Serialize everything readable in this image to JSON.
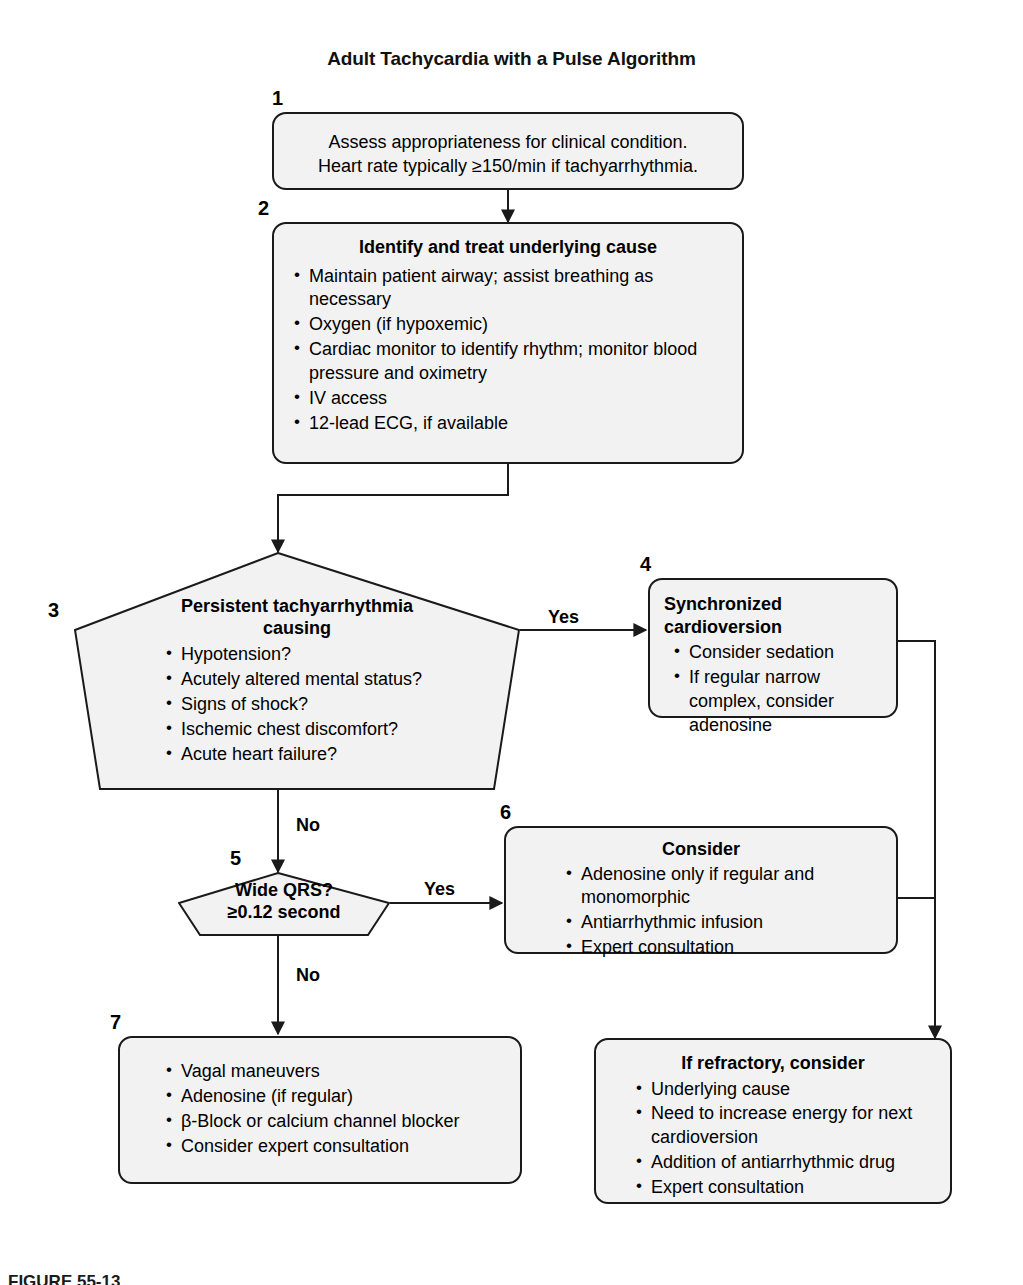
{
  "figure": {
    "title": "Adult Tachycardia with a Pulse Algorithm",
    "bottom_caption": "FIGURE 55-13"
  },
  "colors": {
    "box_fill": "#f2f2f2",
    "stroke": "#1a1a1a",
    "text": "#000000",
    "page_background": "#ffffff"
  },
  "nodes": {
    "step1": {
      "number": "1",
      "lines": [
        "Assess appropriateness for clinical condition.",
        "Heart rate typically ≥150/min if tachyarrhythmia."
      ]
    },
    "step2": {
      "number": "2",
      "title": "Identify and treat underlying cause",
      "bullets": [
        "Maintain patient airway; assist breathing as necessary",
        "Oxygen (if hypoxemic)",
        "Cardiac monitor to identify rhythm; monitor blood pressure and oximetry",
        "IV access",
        "12-lead ECG, if available"
      ]
    },
    "step3": {
      "number": "3",
      "title_line1": "Persistent tachyarrhythmia",
      "title_line2": "causing",
      "bullets": [
        "Hypotension?",
        "Acutely altered mental status?",
        "Signs of shock?",
        "Ischemic chest discomfort?",
        "Acute heart failure?"
      ]
    },
    "step4": {
      "number": "4",
      "title": "Synchronized cardioversion",
      "bullets": [
        "Consider sedation",
        "If regular narrow complex, consider adenosine"
      ]
    },
    "step5": {
      "number": "5",
      "line1": "Wide QRS?",
      "line2": "≥0.12 second"
    },
    "step6": {
      "number": "6",
      "title": "Consider",
      "bullets": [
        "Adenosine only if regular and monomorphic",
        "Antiarrhythmic infusion",
        "Expert consultation"
      ]
    },
    "step7": {
      "number": "7",
      "bullets": [
        "Vagal maneuvers",
        "Adenosine (if regular)",
        "β-Block or calcium channel blocker",
        "Consider expert consultation"
      ]
    },
    "refractory": {
      "title": "If refractory, consider",
      "bullets": [
        "Underlying cause",
        "Need to increase energy for next cardioversion",
        "Addition of antiarrhythmic drug",
        "Expert consultation"
      ]
    }
  },
  "edges": {
    "three_to_four": "Yes",
    "three_to_five": "No",
    "five_to_six": "Yes",
    "five_to_seven": "No"
  }
}
